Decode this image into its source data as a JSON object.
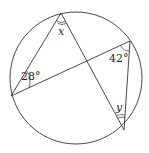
{
  "diagram": {
    "type": "circle-inscribed-angles",
    "circle": {
      "cx": 76,
      "cy": 78,
      "r": 66
    },
    "points": {
      "A": {
        "x": 61,
        "y": 13
      },
      "B": {
        "x": 130,
        "y": 41
      },
      "C": {
        "x": 11,
        "y": 96
      },
      "D": {
        "x": 124,
        "y": 130
      }
    },
    "labels": {
      "x": "x",
      "y": "y",
      "angle_c": "28°",
      "angle_b": "42°"
    },
    "stroke_color": "#333333"
  }
}
